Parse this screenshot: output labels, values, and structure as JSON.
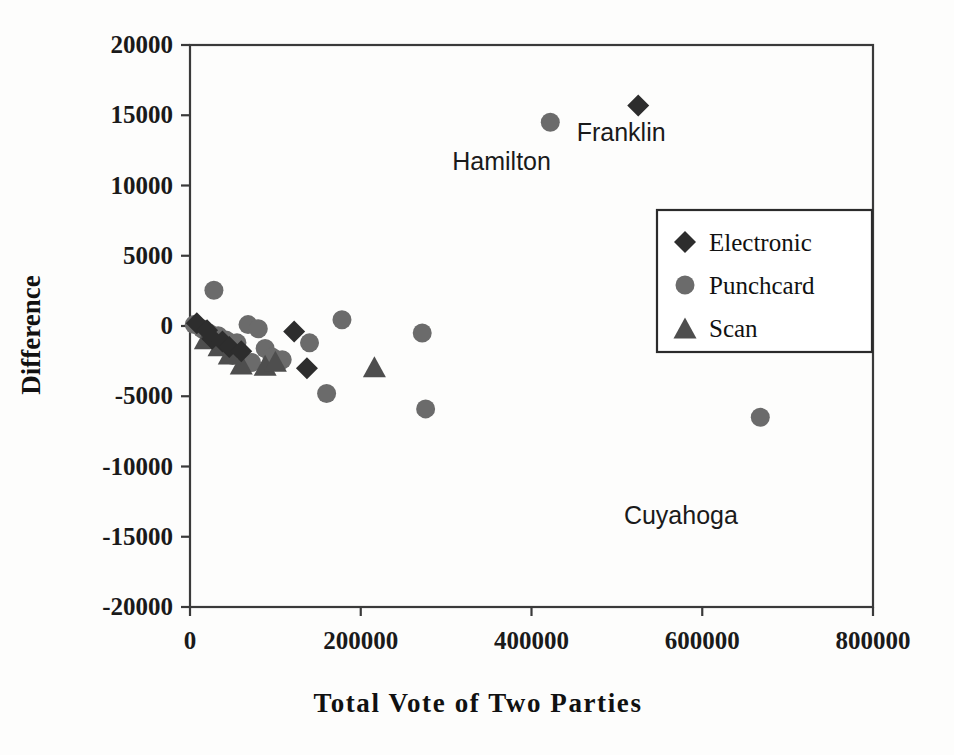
{
  "chart_data": {
    "type": "scatter",
    "title": "",
    "xlabel": "Total Vote of Two Parties",
    "ylabel": "Difference",
    "xlim": [
      0,
      800000
    ],
    "ylim": [
      -20000,
      20000
    ],
    "xticks": [
      "0",
      "200000",
      "400000",
      "600000",
      "800000"
    ],
    "xtick_values": [
      0,
      200000,
      400000,
      600000,
      800000
    ],
    "yticks": [
      "20000",
      "15000",
      "10000",
      "5000",
      "0",
      "-5000",
      "-10000",
      "-15000",
      "-20000"
    ],
    "ytick_values": [
      20000,
      15000,
      10000,
      5000,
      0,
      -5000,
      -10000,
      -15000,
      -20000
    ],
    "grid": false,
    "legend_position": "upper right",
    "series": [
      {
        "name": "Electronic",
        "marker": "diamond",
        "color": "#2d2d2d",
        "points": [
          [
            525000,
            15700
          ],
          [
            122000,
            -400
          ],
          [
            8000,
            200
          ],
          [
            20000,
            -300
          ],
          [
            26000,
            -900
          ],
          [
            38000,
            -1100
          ],
          [
            46000,
            -1500
          ],
          [
            137000,
            -3000
          ],
          [
            60000,
            -1800
          ]
        ]
      },
      {
        "name": "Punchcard",
        "marker": "circle",
        "color": "#6b6b6b",
        "points": [
          [
            422000,
            14500
          ],
          [
            28000,
            2550
          ],
          [
            5000,
            100
          ],
          [
            14000,
            -200
          ],
          [
            22000,
            -500
          ],
          [
            33000,
            -700
          ],
          [
            42000,
            -1000
          ],
          [
            55000,
            -1200
          ],
          [
            68000,
            100
          ],
          [
            80000,
            -200
          ],
          [
            88000,
            -1600
          ],
          [
            96000,
            -2200
          ],
          [
            108000,
            -2400
          ],
          [
            140000,
            -1200
          ],
          [
            178000,
            450
          ],
          [
            160000,
            -4800
          ],
          [
            272000,
            -500
          ],
          [
            276000,
            -5900
          ],
          [
            668000,
            -6500
          ],
          [
            50000,
            -2100
          ],
          [
            72000,
            -2600
          ]
        ]
      },
      {
        "name": "Scan",
        "marker": "triangle",
        "color": "#4e4e4e",
        "points": [
          [
            60000,
            -2700
          ],
          [
            88000,
            -2800
          ],
          [
            216000,
            -2900
          ],
          [
            34000,
            -1400
          ],
          [
            46000,
            -2000
          ],
          [
            100000,
            -2500
          ],
          [
            18000,
            -900
          ]
        ]
      }
    ],
    "annotations": [
      {
        "text": "Hamilton",
        "x": 365000,
        "y": 11100
      },
      {
        "text": "Franklin",
        "x": 505000,
        "y": 13200
      },
      {
        "text": "Cuyahoga",
        "x": 575000,
        "y": -14100
      }
    ]
  },
  "legend": {
    "entries": [
      {
        "label": "Electronic",
        "marker": "diamond"
      },
      {
        "label": "Punchcard",
        "marker": "circle"
      },
      {
        "label": "Scan",
        "marker": "triangle"
      }
    ]
  }
}
